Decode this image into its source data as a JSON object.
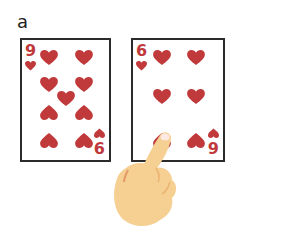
{
  "panel_label": "a",
  "colors": {
    "heart": "#c0393b",
    "border": "#2b2b2b",
    "skin": "#f6cf92",
    "skin_shadow": "#ebb36f"
  },
  "cards": [
    {
      "id": "left",
      "top_rank": "9",
      "bottom_rank": "6",
      "suit": "heart-icon",
      "pip_count": 9
    },
    {
      "id": "right",
      "top_rank": "6",
      "bottom_rank": "9",
      "suit": "heart-icon",
      "pip_count": 6
    }
  ],
  "gesture": {
    "type": "pointing-hand-icon",
    "target": "right card bottom-left heart"
  }
}
